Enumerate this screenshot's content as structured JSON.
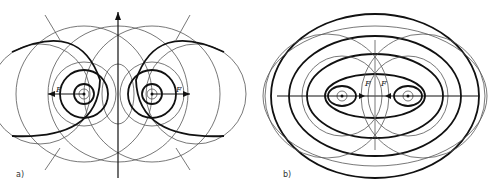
{
  "figure": {
    "panel_a": {
      "label": "a)",
      "force_label": "F",
      "conductor_left": "current-into-page",
      "conductor_right": "current-out-of-page"
    },
    "panel_b": {
      "label": "b)",
      "force_label": "F",
      "conductor_left": "current-out-of-page",
      "conductor_right": "current-out-of-page"
    },
    "colors": {
      "line": "#111111",
      "thin_line": "#555555",
      "background": "#ffffff"
    }
  }
}
